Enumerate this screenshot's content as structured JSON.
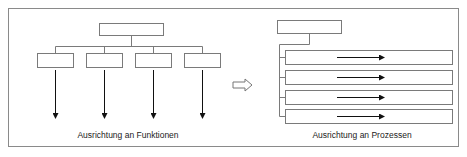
{
  "diagram": {
    "left": {
      "caption": "Ausrichtung an Funktionen",
      "root_box": {
        "x": 99,
        "y": 23,
        "w": 64,
        "h": 12
      },
      "branch_y": 46,
      "children": [
        {
          "x": 37,
          "y": 53,
          "w": 36,
          "h": 14
        },
        {
          "x": 86,
          "y": 53,
          "w": 36,
          "h": 14
        },
        {
          "x": 135,
          "y": 53,
          "w": 36,
          "h": 14
        },
        {
          "x": 184,
          "y": 53,
          "w": 36,
          "h": 14
        }
      ],
      "arrow_from_y": 70,
      "arrow_to_y": 118
    },
    "transition_arrow": {
      "icon": "hollow-right-arrow-icon",
      "x": 233,
      "y": 85
    },
    "right": {
      "caption": "Ausrichtung an Prozessen",
      "root_box": {
        "x": 277,
        "y": 20,
        "w": 64,
        "h": 13
      },
      "spine_x": 279,
      "rows": [
        {
          "x": 285,
          "y": 50,
          "w": 167,
          "h": 14
        },
        {
          "x": 285,
          "y": 70,
          "w": 167,
          "h": 14
        },
        {
          "x": 285,
          "y": 90,
          "w": 167,
          "h": 14
        },
        {
          "x": 285,
          "y": 109,
          "w": 167,
          "h": 14
        }
      ],
      "row_arrow": {
        "from_x": 337,
        "to_x": 384
      }
    },
    "colors": {
      "box_stroke": "#7a7a7a",
      "arrow": "#111111",
      "frame": "#8a8a8a"
    }
  }
}
